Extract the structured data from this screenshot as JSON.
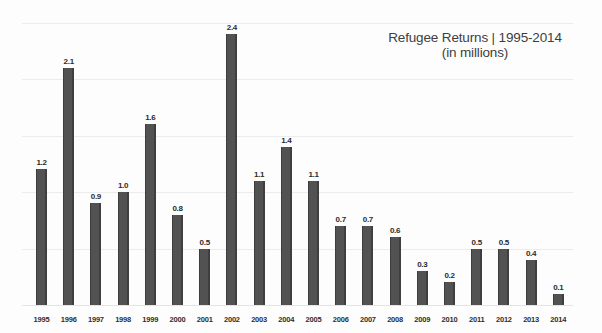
{
  "chart_data": {
    "type": "bar",
    "title": "Refugee Returns | 1995-2014",
    "subtitle": "(in millions)",
    "xlabel": "",
    "ylabel": "",
    "ylim": [
      0,
      2.6
    ],
    "grid": true,
    "gridlines": [
      0.5,
      1.0,
      1.5,
      2.0,
      2.5
    ],
    "legend": null,
    "units": "millions",
    "categories": [
      "1995",
      "1996",
      "1997",
      "1998",
      "1999",
      "2000",
      "2001",
      "2002",
      "2003",
      "2004",
      "2005",
      "2006",
      "2007",
      "2008",
      "2009",
      "2010",
      "2011",
      "2012",
      "2013",
      "2014"
    ],
    "values": [
      1.2,
      2.1,
      0.9,
      1.0,
      1.6,
      0.8,
      0.5,
      2.4,
      1.1,
      1.4,
      1.1,
      0.7,
      0.7,
      0.6,
      0.3,
      0.2,
      0.5,
      0.5,
      0.4,
      0.1
    ],
    "value_labels": [
      "1.2",
      "2.1",
      "0.9",
      "1.0",
      "1.6",
      "0.8",
      "0.5",
      "2.4",
      "1.1",
      "1.4",
      "1.1",
      "0.7",
      "0.7",
      "0.6",
      "0.3",
      "0.2",
      "0.5",
      "0.5",
      "0.4",
      "0.1"
    ],
    "bar_color": "#4b4b4b",
    "grid_color": "#ececec",
    "background_color": "#fdfdfd",
    "text_color": "#2e2e2e",
    "title_color": "#3e3e3e"
  }
}
